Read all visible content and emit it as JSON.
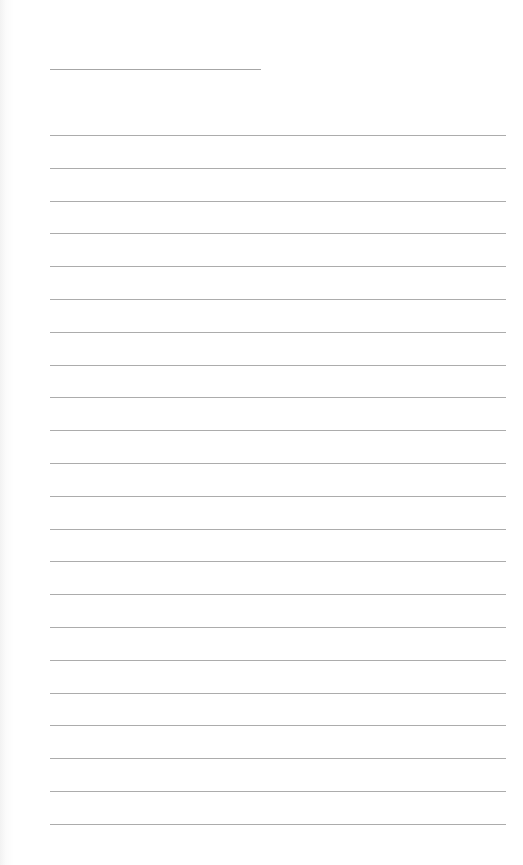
{
  "page": {
    "type": "lined-paper",
    "background_color": "#ffffff",
    "rule_color": "#acacac",
    "header_line": {
      "x": 50,
      "y": 69,
      "width": 211
    },
    "rules": {
      "count": 22,
      "first_y": 135,
      "spacing": 32.8,
      "x": 50,
      "width": 456
    }
  }
}
